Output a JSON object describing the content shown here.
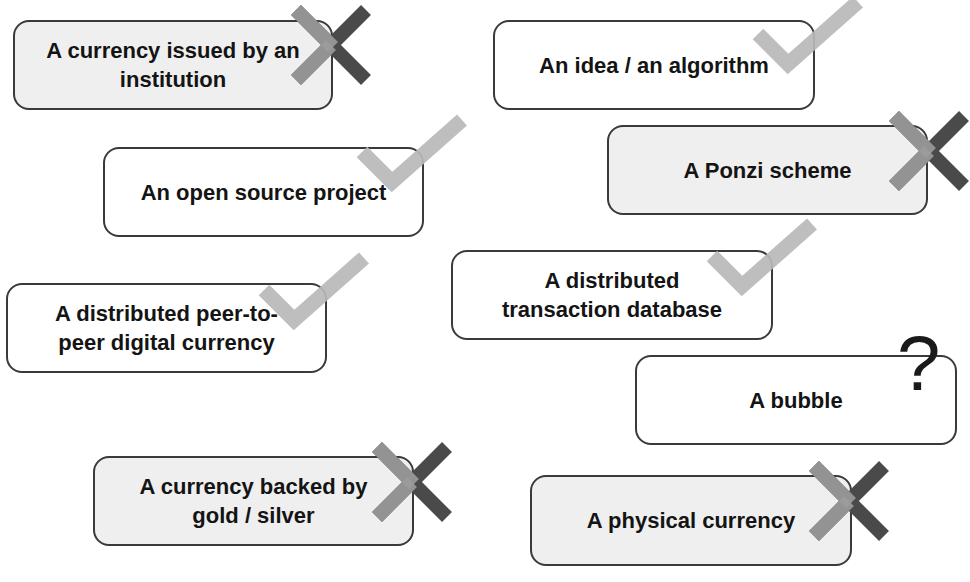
{
  "diagram": {
    "colors": {
      "card_border": "#3a3a3a",
      "card_fill_plain": "#ffffff",
      "card_fill_shaded": "#efefef",
      "text": "#141414",
      "check_mark": "#b8b8b8",
      "x_mark_dark": "#4a4a4a",
      "x_mark_light": "#9c9c9c",
      "question_mark": "#1a1a1a"
    },
    "items": [
      {
        "label": "A currency issued by an institution",
        "verdict": "x-mark",
        "shaded": true
      },
      {
        "label": "An idea / an algorithm",
        "verdict": "check-mark",
        "shaded": false
      },
      {
        "label": "An open source project",
        "verdict": "check-mark",
        "shaded": false
      },
      {
        "label": "A Ponzi scheme",
        "verdict": "x-mark",
        "shaded": true
      },
      {
        "label": "A distributed peer-to-peer digital currency",
        "verdict": "check-mark",
        "shaded": false
      },
      {
        "label": "A distributed transaction database",
        "verdict": "check-mark",
        "shaded": false
      },
      {
        "label": "A bubble",
        "verdict": "question-mark",
        "symbol": "?",
        "shaded": false
      },
      {
        "label": "A currency backed by gold / silver",
        "verdict": "x-mark",
        "shaded": true
      },
      {
        "label": "A physical currency",
        "verdict": "x-mark",
        "shaded": true
      }
    ]
  }
}
